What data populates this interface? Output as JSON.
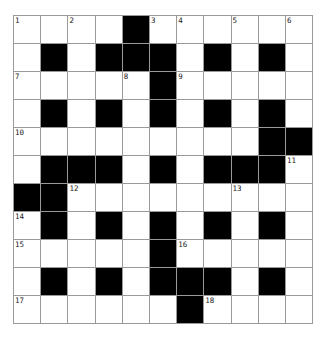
{
  "puzzle": {
    "rows": 11,
    "cols": 11,
    "colors": {
      "block": "#000000",
      "cell": "#ffffff",
      "line": "#9a9a9a"
    },
    "grid": [
      "....#......",
      ".#.###.#.#.",
      ".....#.....",
      ".#.#.#.#.#.",
      ".........##",
      ".###.#.###.",
      "##.........",
      ".#.#.#.#.#.",
      ".....#.....",
      ".#.#.###.#.",
      "......#...."
    ],
    "numbers": [
      {
        "r": 0,
        "c": 0,
        "n": "1"
      },
      {
        "r": 0,
        "c": 2,
        "n": "2"
      },
      {
        "r": 0,
        "c": 5,
        "n": "3"
      },
      {
        "r": 0,
        "c": 6,
        "n": "4"
      },
      {
        "r": 0,
        "c": 8,
        "n": "5"
      },
      {
        "r": 0,
        "c": 10,
        "n": "6"
      },
      {
        "r": 2,
        "c": 0,
        "n": "7"
      },
      {
        "r": 2,
        "c": 4,
        "n": "8"
      },
      {
        "r": 2,
        "c": 6,
        "n": "9"
      },
      {
        "r": 4,
        "c": 0,
        "n": "10"
      },
      {
        "r": 5,
        "c": 10,
        "n": "11"
      },
      {
        "r": 6,
        "c": 2,
        "n": "12"
      },
      {
        "r": 6,
        "c": 8,
        "n": "13"
      },
      {
        "r": 7,
        "c": 0,
        "n": "14"
      },
      {
        "r": 8,
        "c": 0,
        "n": "15"
      },
      {
        "r": 8,
        "c": 6,
        "n": "16"
      },
      {
        "r": 10,
        "c": 0,
        "n": "17"
      },
      {
        "r": 10,
        "c": 7,
        "n": "18"
      }
    ]
  }
}
